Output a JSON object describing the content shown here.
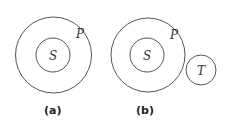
{
  "diagrams": [
    {
      "caption": "(a)",
      "circles": [
        {
          "label": "P",
          "role": "outer"
        },
        {
          "label": "S",
          "role": "inner"
        }
      ]
    },
    {
      "caption": "(b)",
      "circles": [
        {
          "label": "P",
          "role": "outer"
        },
        {
          "label": "S",
          "role": "inner"
        },
        {
          "label": "T",
          "role": "separate"
        }
      ]
    }
  ],
  "colors": {
    "stroke": "#555555",
    "text": "#333333"
  }
}
